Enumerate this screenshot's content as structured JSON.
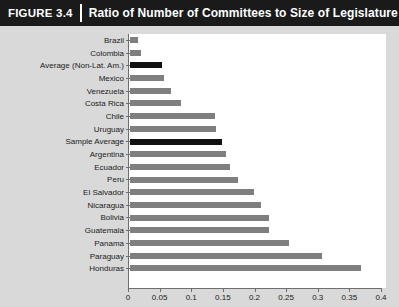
{
  "header": {
    "figure_tag": "FIGURE",
    "figure_number": "3.4",
    "title": "Ratio of Number of Committees to Size of Legislature"
  },
  "colors": {
    "titlebar_background": "#1a1a1a",
    "titlebar_text": "#ffffff",
    "panel_background": "#d9d9d9",
    "plot_background": "#ffffff",
    "bar_default": "#7f7f7f",
    "bar_highlight": "#111111",
    "axis": "#6e6e6e"
  },
  "chart_data": {
    "type": "bar",
    "orientation": "horizontal",
    "title": "Ratio of Number of Committees to Size of Legislature",
    "xlabel": "",
    "ylabel": "",
    "xlim": [
      0,
      0.4
    ],
    "grid": false,
    "legend": null,
    "xticks": [
      "0",
      "0.05",
      "0.1",
      "0.15",
      "0.2",
      "0.25",
      "0.3",
      "0.35",
      "0.4"
    ],
    "xtick_values": [
      0,
      0.05,
      0.1,
      0.15,
      0.2,
      0.25,
      0.3,
      0.35,
      0.4
    ],
    "categories": [
      "Brazil",
      "Colombia",
      "Average (Non-Lat. Am.)",
      "Mexico",
      "Venezuela",
      "Costa Rica",
      "Chile",
      "Uruguay",
      "Sample Average",
      "Argentina",
      "Ecuador",
      "Peru",
      "El Salvador",
      "Nicaragua",
      "Bolivia",
      "Guatemala",
      "Panama",
      "Paraguay",
      "Honduras"
    ],
    "values": [
      0.013,
      0.018,
      0.051,
      0.054,
      0.065,
      0.08,
      0.134,
      0.136,
      0.146,
      0.152,
      0.158,
      0.171,
      0.196,
      0.207,
      0.219,
      0.22,
      0.251,
      0.303,
      0.366
    ],
    "highlighted": [
      "Average (Non-Lat. Am.)",
      "Sample Average"
    ]
  }
}
